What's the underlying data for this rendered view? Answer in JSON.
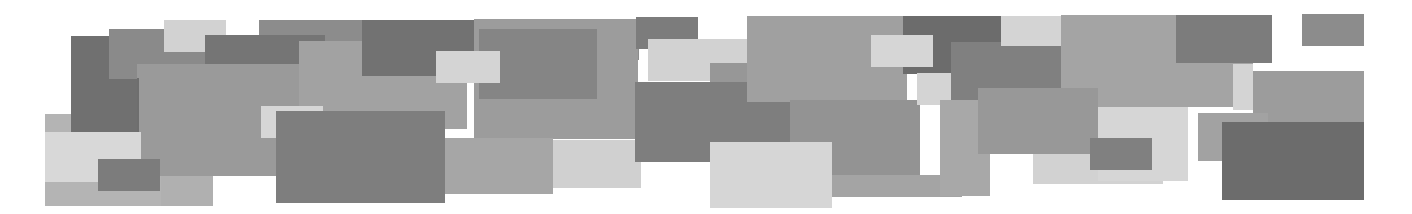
{
  "banner": {
    "description": "Abstract decorative banner of overlapping gray rectangles",
    "background": "#ffffff",
    "width": 1412,
    "height": 214,
    "rectangles": [
      {
        "x": 45,
        "y": 114,
        "w": 168,
        "h": 92,
        "color": "#b4b4b4"
      },
      {
        "x": 259,
        "y": 20,
        "w": 380,
        "h": 40,
        "color": "#8c8c8c"
      },
      {
        "x": 71,
        "y": 36,
        "w": 66,
        "h": 98,
        "color": "#707070"
      },
      {
        "x": 109,
        "y": 29,
        "w": 96,
        "h": 50,
        "color": "#8a8a8a"
      },
      {
        "x": 164,
        "y": 20,
        "w": 62,
        "h": 32,
        "color": "#d2d2d2"
      },
      {
        "x": 205,
        "y": 35,
        "w": 120,
        "h": 30,
        "color": "#757575"
      },
      {
        "x": 137,
        "y": 64,
        "w": 164,
        "h": 112,
        "color": "#9a9a9a"
      },
      {
        "x": 137,
        "y": 78,
        "w": 2,
        "h": 54,
        "color": "#6e6e6e"
      },
      {
        "x": 299,
        "y": 41,
        "w": 168,
        "h": 88,
        "color": "#a2a2a2"
      },
      {
        "x": 362,
        "y": 20,
        "w": 112,
        "h": 56,
        "color": "#727272"
      },
      {
        "x": 474,
        "y": 19,
        "w": 164,
        "h": 120,
        "color": "#9c9c9c"
      },
      {
        "x": 479,
        "y": 29,
        "w": 118,
        "h": 70,
        "color": "#858585"
      },
      {
        "x": 436,
        "y": 51,
        "w": 64,
        "h": 32,
        "color": "#d4d4d4"
      },
      {
        "x": 45,
        "y": 132,
        "w": 96,
        "h": 50,
        "color": "#d8d8d8"
      },
      {
        "x": 98,
        "y": 159,
        "w": 62,
        "h": 32,
        "color": "#7c7c7c"
      },
      {
        "x": 161,
        "y": 176,
        "w": 52,
        "h": 30,
        "color": "#b0b0b0"
      },
      {
        "x": 261,
        "y": 106,
        "w": 62,
        "h": 32,
        "color": "#d6d6d6"
      },
      {
        "x": 276,
        "y": 111,
        "w": 169,
        "h": 92,
        "color": "#7e7e7e"
      },
      {
        "x": 445,
        "y": 138,
        "w": 108,
        "h": 56,
        "color": "#a6a6a6"
      },
      {
        "x": 553,
        "y": 140,
        "w": 88,
        "h": 48,
        "color": "#d0d0d0"
      },
      {
        "x": 636,
        "y": 17,
        "w": 62,
        "h": 32,
        "color": "#7c7c7c"
      },
      {
        "x": 648,
        "y": 39,
        "w": 100,
        "h": 42,
        "color": "#d2d2d2"
      },
      {
        "x": 710,
        "y": 63,
        "w": 40,
        "h": 20,
        "color": "#979797"
      },
      {
        "x": 635,
        "y": 82,
        "w": 155,
        "h": 80,
        "color": "#7e7e7e"
      },
      {
        "x": 747,
        "y": 16,
        "w": 160,
        "h": 86,
        "color": "#a0a0a0"
      },
      {
        "x": 790,
        "y": 100,
        "w": 130,
        "h": 80,
        "color": "#939393"
      },
      {
        "x": 710,
        "y": 142,
        "w": 122,
        "h": 66,
        "color": "#d6d6d6"
      },
      {
        "x": 832,
        "y": 175,
        "w": 130,
        "h": 22,
        "color": "#a4a4a4"
      },
      {
        "x": 903,
        "y": 16,
        "w": 98,
        "h": 58,
        "color": "#6c6c6c"
      },
      {
        "x": 871,
        "y": 35,
        "w": 62,
        "h": 32,
        "color": "#d6d6d6"
      },
      {
        "x": 917,
        "y": 73,
        "w": 34,
        "h": 32,
        "color": "#d4d4d4"
      },
      {
        "x": 951,
        "y": 42,
        "w": 110,
        "h": 70,
        "color": "#808080"
      },
      {
        "x": 940,
        "y": 100,
        "w": 50,
        "h": 96,
        "color": "#a8a8a8"
      },
      {
        "x": 1001,
        "y": 16,
        "w": 60,
        "h": 30,
        "color": "#d4d4d4"
      },
      {
        "x": 1061,
        "y": 15,
        "w": 192,
        "h": 92,
        "color": "#a4a4a4"
      },
      {
        "x": 978,
        "y": 88,
        "w": 120,
        "h": 66,
        "color": "#989898"
      },
      {
        "x": 1033,
        "y": 154,
        "w": 130,
        "h": 30,
        "color": "#d2d2d2"
      },
      {
        "x": 1098,
        "y": 107,
        "w": 90,
        "h": 74,
        "color": "#d6d6d6"
      },
      {
        "x": 1090,
        "y": 138,
        "w": 62,
        "h": 32,
        "color": "#808080"
      },
      {
        "x": 1176,
        "y": 15,
        "w": 96,
        "h": 48,
        "color": "#7c7c7c"
      },
      {
        "x": 1233,
        "y": 64,
        "w": 20,
        "h": 46,
        "color": "#d4d4d4"
      },
      {
        "x": 1253,
        "y": 71,
        "w": 111,
        "h": 52,
        "color": "#9c9c9c"
      },
      {
        "x": 1198,
        "y": 113,
        "w": 70,
        "h": 48,
        "color": "#a2a2a2"
      },
      {
        "x": 1222,
        "y": 122,
        "w": 142,
        "h": 78,
        "color": "#6c6c6c"
      },
      {
        "x": 1302,
        "y": 14,
        "w": 62,
        "h": 32,
        "color": "#8c8c8c"
      }
    ]
  }
}
